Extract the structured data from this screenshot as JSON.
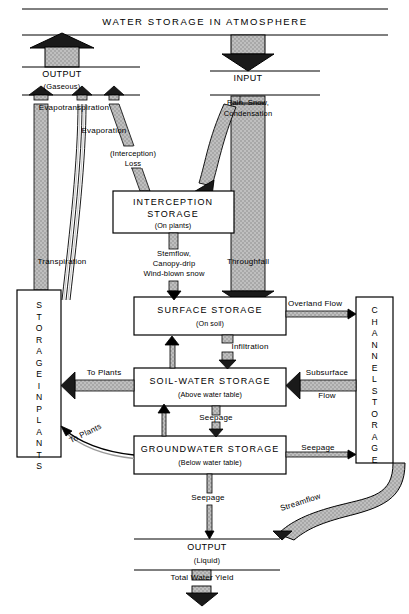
{
  "diagram": {
    "title": "WATER STORAGE IN ATMOSPHERE",
    "type": "hydrologic-cycle-flow-diagram"
  },
  "top": {
    "output_label": "OUTPUT",
    "output_sub": "(Gaseous)",
    "input_label": "INPUT",
    "input_sub_line1": "Rain, Snow,",
    "input_sub_line2": "Condensation"
  },
  "flux_labels": {
    "evapotranspiration": "Evapotranspiration",
    "evaporation": "Evaporation",
    "interception_loss_line1": "(Interception)",
    "interception_loss_line2": "Loss",
    "transpiration": "Transpiration",
    "stemflow_line1": "Stemflow,",
    "stemflow_line2": "Canopy-drip",
    "stemflow_line3": "Wind-blown snow",
    "throughfall": "Throughfall",
    "overland_flow": "Overland Flow",
    "infiltration": "Infiltration",
    "to_plants_soil": "To Plants",
    "to_plants_ground": "To Plants",
    "subsurface_line1": "Subsurface",
    "subsurface_line2": "Flow",
    "seepage_soil_to_ground": "Seepage",
    "seepage_ground_to_channel": "Seepage",
    "seepage_ground_to_output": "Seepage",
    "streamflow": "Streamflow",
    "total_water_yield": "Total Water Yield"
  },
  "boxes": {
    "interception": {
      "title": "INTERCEPTION STORAGE",
      "line1": "INTERCEPTION",
      "line2": "STORAGE",
      "sub": "(On plants)"
    },
    "surface": {
      "title": "SURFACE STORAGE",
      "line1": "SURFACE  STORAGE",
      "sub": "(On soil)"
    },
    "soil_water": {
      "title": "SOIL-WATER STORAGE",
      "line1": "SOIL-WATER  STORAGE",
      "sub": "(Above water table)"
    },
    "groundwater": {
      "title": "GROUNDWATER STORAGE",
      "line1": "GROUNDWATER  STORAGE",
      "sub": "(Below water table)"
    },
    "plants": {
      "title": "STORAGE IN PLANTS",
      "line1": "STORAGE",
      "line2": "IN",
      "line3": "PLANTS"
    },
    "channel": {
      "title": "CHANNEL STORAGE",
      "line1": "CHANNEL",
      "line2": "STORAGE"
    }
  },
  "bottom": {
    "output_label": "OUTPUT",
    "output_sub": "(Liquid)"
  },
  "colors": {
    "ink": "#000000",
    "fill_gray": "#b4b4b4",
    "fill_dark": "#1a1a1a",
    "paper": "#ffffff"
  }
}
